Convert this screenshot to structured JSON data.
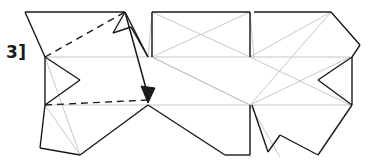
{
  "figure": {
    "step_label": "3]",
    "title": "",
    "colors": {
      "fold_line": "#b9b9b9",
      "outline": "#1a1a1a",
      "dashed_guide": "#1a1a1a",
      "arrow": "#1a1a1a",
      "background": "#ffffff",
      "label_color": "#1a1a1a"
    },
    "canvas": {
      "width": 371,
      "height": 167
    },
    "geometry": {
      "fold_lines": [
        "M45,57 L350,57",
        "M45,105 L352,105",
        "M152,12 L152,57",
        "M250,12 L250,57",
        "M250,105 L250,157",
        "M152,57 L250,12",
        "M152,57 L250,105",
        "M250,57 L152,12",
        "M250,105 L152,57",
        "M250,57 L331,12",
        "M250,57 L350,105",
        "M250,105 L331,12",
        "M250,105 L350,57",
        "M45,105 L80,155",
        "M45,57 L80,155",
        "M250,105 L280,157"
      ],
      "outline_paths": [
        "M25,12 L125,12",
        "M25,12 L45,57",
        "M45,57 L45,105",
        "M45,57 L80,80",
        "M80,80 L45,105",
        "M45,105 L40,148",
        "M40,148 L80,155",
        "M80,155 L148,105",
        "M148,105 L225,155",
        "M225,155 L250,155",
        "M250,155 L250,105",
        "M152,12 L152,57",
        "M152,12 L250,12",
        "M250,12 L250,57",
        "M254,12 L331,12",
        "M331,12 L360,45",
        "M360,45 L352,57",
        "M352,57 L352,105",
        "M352,57 L318,80",
        "M318,80 L352,105",
        "M352,105 L318,155",
        "M318,155 L280,135",
        "M280,135 L268,152",
        "M268,152 L252,105",
        "M125,12 L113,33",
        "M113,33 L131,27",
        "M131,27 L148,57",
        "M125,12 L148,57"
      ],
      "dashed_paths": [
        "M45,57 L125,12",
        "M45,105 L148,100"
      ],
      "arrow": {
        "from": [
          125,
          12
        ],
        "to": [
          148,
          100
        ],
        "head_points": "148,103 141,88 155,88"
      }
    }
  }
}
